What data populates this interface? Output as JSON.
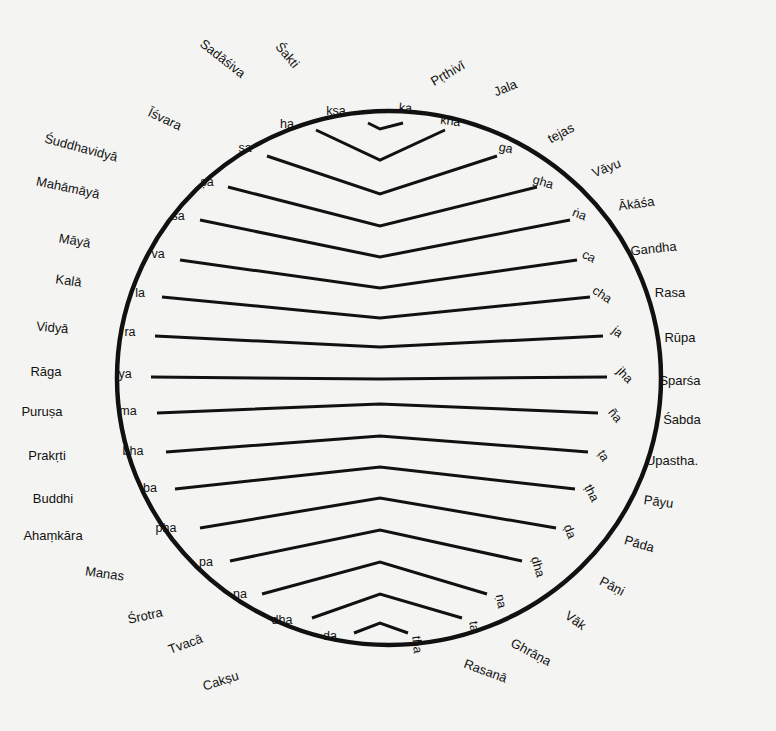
{
  "diagram": {
    "circle": {
      "cx": 389,
      "cy": 378,
      "rx": 272,
      "ry": 267,
      "stroke": "#111111"
    },
    "outer_labels": [
      {
        "text": "Sadāśiva",
        "x": 220,
        "y": 62,
        "rot": 38
      },
      {
        "text": "Śakti",
        "x": 284,
        "y": 58,
        "rot": 50
      },
      {
        "text": "Pṛthivī",
        "x": 450,
        "y": 77,
        "rot": -30
      },
      {
        "text": "Jala",
        "x": 507,
        "y": 92,
        "rot": -22
      },
      {
        "text": "tejas",
        "x": 563,
        "y": 137,
        "rot": -28
      },
      {
        "text": "Vāyu",
        "x": 608,
        "y": 172,
        "rot": -22
      },
      {
        "text": "Ākāśa",
        "x": 637,
        "y": 208,
        "rot": -8
      },
      {
        "text": "Gandha",
        "x": 654,
        "y": 253,
        "rot": -6
      },
      {
        "text": "Rasa",
        "x": 670,
        "y": 297,
        "rot": 0
      },
      {
        "text": "Rūpa",
        "x": 680,
        "y": 342,
        "rot": 0
      },
      {
        "text": "Sparśa",
        "x": 680,
        "y": 385,
        "rot": 0
      },
      {
        "text": "Śabda",
        "x": 682,
        "y": 424,
        "rot": 0
      },
      {
        "text": "Upastha.",
        "x": 672,
        "y": 465,
        "rot": 0
      },
      {
        "text": "Pāyu",
        "x": 658,
        "y": 506,
        "rot": 8
      },
      {
        "text": "Pāda",
        "x": 638,
        "y": 548,
        "rot": 16
      },
      {
        "text": "Pāṇi",
        "x": 610,
        "y": 590,
        "rot": 28
      },
      {
        "text": "Vāk",
        "x": 573,
        "y": 624,
        "rot": 36
      },
      {
        "text": "Ghrāṇa",
        "x": 529,
        "y": 656,
        "rot": 28
      },
      {
        "text": "Rasanā",
        "x": 484,
        "y": 675,
        "rot": 20
      },
      {
        "text": "Īśvara",
        "x": 163,
        "y": 123,
        "rot": 25
      },
      {
        "text": "Śuddhavidyā",
        "x": 80,
        "y": 152,
        "rot": 15
      },
      {
        "text": "Mahāmāyā",
        "x": 67,
        "y": 192,
        "rot": 12
      },
      {
        "text": "Māyā",
        "x": 74,
        "y": 245,
        "rot": 10
      },
      {
        "text": "Kalā",
        "x": 68,
        "y": 285,
        "rot": 8
      },
      {
        "text": "Vidyā",
        "x": 52,
        "y": 332,
        "rot": 5
      },
      {
        "text": "Rāga",
        "x": 46,
        "y": 376,
        "rot": 0
      },
      {
        "text": "Puruṣa",
        "x": 42,
        "y": 416,
        "rot": 0
      },
      {
        "text": "Prakṛti",
        "x": 47,
        "y": 460,
        "rot": 0
      },
      {
        "text": "Buddhi",
        "x": 53,
        "y": 503,
        "rot": 0
      },
      {
        "text": "Ahaṃkāra",
        "x": 53,
        "y": 540,
        "rot": 0
      },
      {
        "text": "Manas",
        "x": 104,
        "y": 578,
        "rot": 8
      },
      {
        "text": "Śrotra",
        "x": 146,
        "y": 620,
        "rot": -12
      },
      {
        "text": "Tvacā",
        "x": 187,
        "y": 648,
        "rot": -20
      },
      {
        "text": "Cakṣu",
        "x": 222,
        "y": 685,
        "rot": -18
      }
    ],
    "chevrons": [
      {
        "left": "kṣa",
        "right": "ka",
        "y_edge": 123,
        "y_mid": 129,
        "xl": 368,
        "xr": 403,
        "ll": [
          336,
          115
        ],
        "lr": [
          405,
          112
        ]
      },
      {
        "left": "ha",
        "right": "kha",
        "y_edge": 130,
        "y_mid": 160,
        "xl": 316,
        "xr": 445,
        "ll": [
          287,
          128
        ],
        "lr": [
          450,
          125
        ]
      },
      {
        "left": "sa",
        "right": "ga",
        "y_edge": 156,
        "y_mid": 194,
        "xl": 267,
        "xr": 497,
        "ll": [
          245,
          152
        ],
        "lr": [
          505,
          152
        ]
      },
      {
        "left": "ṣa",
        "right": "gha",
        "y_edge": 187,
        "y_mid": 226,
        "xl": 228,
        "xr": 537,
        "ll": [
          207,
          186
        ],
        "lr": [
          542,
          186
        ]
      },
      {
        "left": "śa",
        "right": "ṅa",
        "y_edge": 220,
        "y_mid": 257,
        "xl": 200,
        "xr": 570,
        "ll": [
          178,
          220
        ],
        "lr": [
          578,
          218
        ]
      },
      {
        "left": "va",
        "right": "ca",
        "y_edge": 260,
        "y_mid": 288,
        "xl": 180,
        "xr": 577,
        "ll": [
          158,
          258
        ],
        "lr": [
          587,
          260
        ]
      },
      {
        "left": "la",
        "right": "cha",
        "y_edge": 297,
        "y_mid": 318,
        "xl": 162,
        "xr": 590,
        "ll": [
          140,
          297
        ],
        "lr": [
          600,
          298
        ]
      },
      {
        "left": "ra",
        "right": "ja",
        "y_edge": 336,
        "y_mid": 347,
        "xl": 155,
        "xr": 603,
        "ll": [
          130,
          336
        ],
        "lr": [
          615,
          335
        ]
      },
      {
        "left": "ya",
        "right": "jha",
        "y_edge": 377,
        "y_mid": 379,
        "xl": 151,
        "xr": 607,
        "ll": [
          125,
          378
        ],
        "lr": [
          622,
          378
        ]
      },
      {
        "left": "ma",
        "right": "ña",
        "y_edge": 413,
        "y_mid": 404,
        "xl": 157,
        "xr": 598,
        "ll": [
          128,
          415
        ],
        "lr": [
          612,
          418
        ]
      },
      {
        "left": "bha",
        "right": "ṭa",
        "y_edge": 452,
        "y_mid": 436,
        "xl": 166,
        "xr": 588,
        "ll": [
          133,
          455
        ],
        "lr": [
          600,
          458
        ]
      },
      {
        "left": "ba",
        "right": "ṭha",
        "y_edge": 489,
        "y_mid": 467,
        "xl": 175,
        "xr": 575,
        "ll": [
          150,
          492
        ],
        "lr": [
          588,
          495
        ]
      },
      {
        "left": "pha",
        "right": "ḍa",
        "y_edge": 528,
        "y_mid": 498,
        "xl": 200,
        "xr": 556,
        "ll": [
          166,
          532
        ],
        "lr": [
          566,
          533
        ]
      },
      {
        "left": "pa",
        "right": "ḍha",
        "y_edge": 561,
        "y_mid": 530,
        "xl": 230,
        "xr": 522,
        "ll": [
          206,
          566
        ],
        "lr": [
          534,
          568
        ]
      },
      {
        "left": "na",
        "right": "ṇa",
        "y_edge": 594,
        "y_mid": 562,
        "xl": 262,
        "xr": 487,
        "ll": [
          240,
          598
        ],
        "lr": [
          497,
          602
        ]
      },
      {
        "left": "dha",
        "right": "ta",
        "y_edge": 618,
        "y_mid": 594,
        "xl": 312,
        "xr": 462,
        "ll": [
          282,
          624
        ],
        "lr": [
          470,
          627
        ]
      },
      {
        "left": "da",
        "right": "tha",
        "y_edge": 633,
        "y_mid": 623,
        "xl": 354,
        "xr": 408,
        "ll": [
          330,
          640
        ],
        "lr": [
          413,
          645
        ]
      }
    ],
    "center_x": 380
  }
}
